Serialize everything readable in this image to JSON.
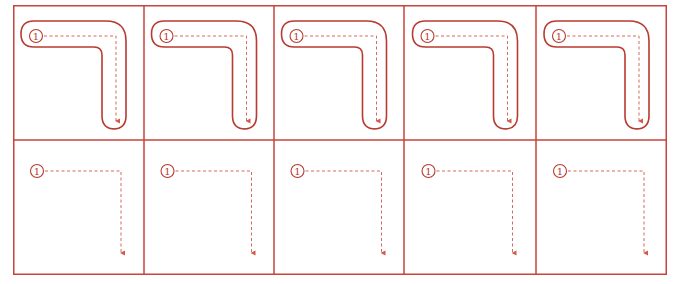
{
  "worksheet": {
    "columns": 5,
    "rows": 2,
    "colors": {
      "border": "#c4453a",
      "outline": "#b83a30",
      "guide": "#d05a4c",
      "number": "#b83a30"
    },
    "stroke_order_label": "①",
    "row_traced": {
      "label": "Tracing row with stroke outline",
      "cells": [
        {
          "number": "①"
        },
        {
          "number": "①"
        },
        {
          "number": "①"
        },
        {
          "number": "①"
        },
        {
          "number": "①"
        }
      ]
    },
    "row_practice": {
      "label": "Practice row with guide arrow only",
      "cells": [
        {
          "number": "①"
        },
        {
          "number": "①"
        },
        {
          "number": "①"
        },
        {
          "number": "①"
        },
        {
          "number": "①"
        }
      ]
    }
  }
}
